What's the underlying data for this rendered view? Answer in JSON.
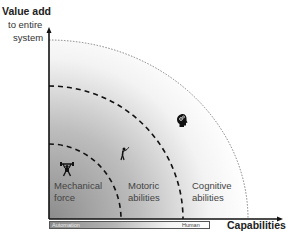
{
  "axes": {
    "y_title": "Value add",
    "y_sub_line1": "to entire",
    "y_sub_line2": "system",
    "x_title": "Capabilities"
  },
  "regions": [
    {
      "name": "mechanical-force",
      "line1": "Mechanical",
      "line2": "force",
      "icon": "weightlifter-icon"
    },
    {
      "name": "motoric-abilities",
      "line1": "Motoric",
      "line2": "abilities",
      "icon": "golfer-icon"
    },
    {
      "name": "cognitive-abilities",
      "line1": "Cognitive",
      "line2": "abilities",
      "icon": "brain-gears-icon"
    }
  ],
  "spectrum_bar": {
    "left_label": "Automation",
    "right_label": "Human"
  },
  "colors": {
    "gradient_dark": "#8c8c8c",
    "gradient_light": "#ffffff",
    "axis": "#111111",
    "dashed": "#111111"
  }
}
